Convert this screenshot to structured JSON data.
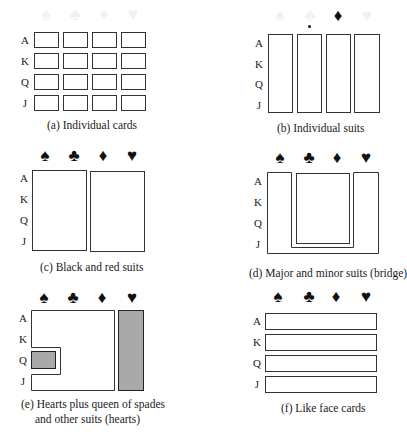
{
  "figure": {
    "row_labels": [
      "A",
      "K",
      "Q",
      "J"
    ],
    "suits": [
      "♠",
      "♣",
      "♦",
      "♥"
    ],
    "suit_names": [
      "spades",
      "clubs",
      "diamonds",
      "hearts"
    ],
    "colors": {
      "line": "#333333",
      "shade": "#a9a9a9",
      "faded_suit": "#f1f1f1"
    },
    "panels": [
      {
        "id": "a",
        "caption": "(a) Individual cards",
        "grouping": "16 cells, one per card"
      },
      {
        "id": "b",
        "caption": "(b) Individual suits",
        "grouping": "4 columns, one per suit"
      },
      {
        "id": "c",
        "caption": "(c) Black and red suits",
        "grouping": "spades+clubs | diamonds+hearts"
      },
      {
        "id": "d",
        "caption": "(d) Major and minor suits (bridge)",
        "grouping": "U-shape spades+hearts around clubs+diamonds"
      },
      {
        "id": "e",
        "caption_line1": "(e) Hearts plus queen of spades",
        "caption_line2": "and other suits (hearts)",
        "grouping": "shaded hearts column + shaded Q of spades; remaining region unshaded"
      },
      {
        "id": "f",
        "caption": "(f) Like face cards",
        "grouping": "4 rows, one per rank"
      }
    ]
  }
}
